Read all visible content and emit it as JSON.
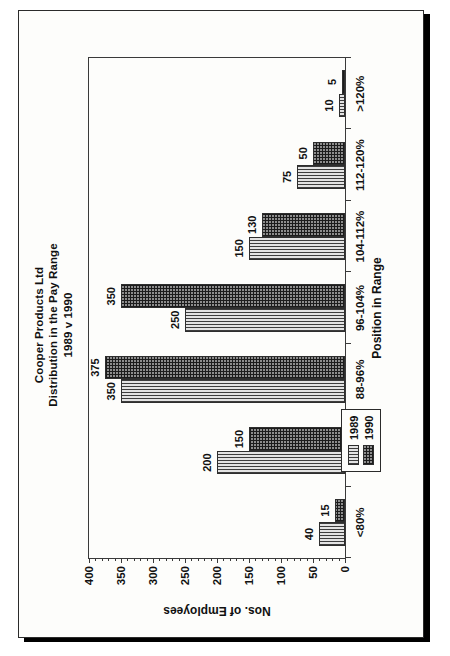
{
  "document": {
    "kind": "scanned-chart-page"
  },
  "chart_data": {
    "type": "bar",
    "title": "Cooper Products Ltd",
    "subtitle": "Distribution in the Pay Range",
    "subtitle2": "1989 v 1990",
    "title_lines": [
      "Cooper Products Ltd",
      "Distribution in the Pay Range",
      "1989 v 1990"
    ],
    "xlabel": "Position in Range",
    "ylabel": "Nos. of Employees",
    "categories": [
      "<80%",
      "80-88%",
      "88-96%",
      "96-104%",
      "104-112%",
      "112-120%",
      ">120%"
    ],
    "series": [
      {
        "name": "1989",
        "values": [
          40,
          200,
          350,
          250,
          150,
          75,
          10
        ],
        "pattern": "vertical-stripes",
        "color": "#e3e3e3"
      },
      {
        "name": "1990",
        "values": [
          15,
          150,
          375,
          350,
          130,
          50,
          5
        ],
        "pattern": "cross-hatch",
        "color": "#8d8d8d"
      }
    ],
    "ylim": [
      0,
      400
    ],
    "yticks": [
      0,
      50,
      100,
      150,
      200,
      250,
      300,
      350,
      400
    ],
    "ytick_labels": [
      "0",
      "50",
      "100",
      "150",
      "200",
      "250",
      "300",
      "350",
      "400"
    ],
    "grid": false,
    "legend_position": "bottom-left-inside-plot",
    "data_labels": true,
    "orientation": "rotated-90-ccw-on-page"
  },
  "legend": {
    "entries": [
      {
        "label": "1989"
      },
      {
        "label": "1990"
      }
    ]
  }
}
